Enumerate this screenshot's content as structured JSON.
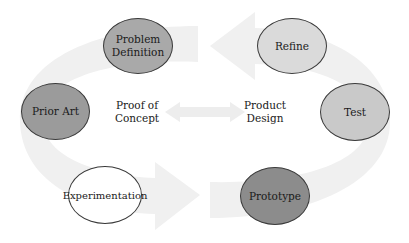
{
  "diagram": {
    "left_cycle": {
      "label_line1": "Proof of",
      "label_line2": "Concept",
      "nodes": [
        {
          "id": "problem-definition",
          "line1": "Problem",
          "line2": "Definition",
          "fill": "#a9a9a9"
        },
        {
          "id": "prior-art",
          "line1": "Prior Art",
          "line2": "",
          "fill": "#9b9b9b"
        },
        {
          "id": "experimentation",
          "line1": "Experimentation",
          "line2": "",
          "fill": "#ffffff"
        }
      ]
    },
    "right_cycle": {
      "label_line1": "Product",
      "label_line2": "Design",
      "nodes": [
        {
          "id": "refine",
          "line1": "Refine",
          "line2": "",
          "fill": "#dadada"
        },
        {
          "id": "test",
          "line1": "Test",
          "line2": "",
          "fill": "#c9c9c9"
        },
        {
          "id": "prototype",
          "line1": "Prototype",
          "line2": "",
          "fill": "#8c8c8c"
        }
      ]
    },
    "connector": {
      "type": "double-arrow",
      "direction": "left-right"
    },
    "colors": {
      "arrow_band": "#f1f1f1",
      "outline": "#3a3a3a",
      "text": "#1a1a1a"
    }
  }
}
